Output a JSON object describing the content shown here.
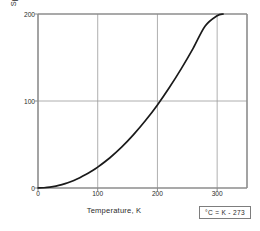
{
  "chart_data": {
    "type": "line",
    "title": "",
    "xlabel": "Temperature,  K",
    "ylabel": "Specific Enthalpy  Dh  in kJ.kg",
    "ylabel_exponent": "-1",
    "xlim": [
      0,
      350
    ],
    "ylim": [
      0,
      200
    ],
    "xticks": [
      0,
      100,
      200,
      300
    ],
    "xtick_labels": [
      "0",
      "100",
      "200",
      "300"
    ],
    "yticks": [
      0,
      100,
      200
    ],
    "ytick_labels": [
      "0",
      "100",
      "200"
    ],
    "grid": true,
    "legend": "none",
    "series": [
      {
        "name": "Specific enthalpy",
        "x": [
          0,
          10,
          20,
          30,
          40,
          50,
          60,
          70,
          80,
          90,
          100,
          120,
          140,
          160,
          180,
          200,
          220,
          240,
          260,
          280,
          300,
          310
        ],
        "y": [
          0,
          0.3,
          1.0,
          2.2,
          3.9,
          6.0,
          8.7,
          11.8,
          15.4,
          19.5,
          24.0,
          34.5,
          46.9,
          61.3,
          77.5,
          95.5,
          115.5,
          137.2,
          160.8,
          186.2,
          198.0,
          200.0
        ]
      }
    ],
    "annotations": [
      {
        "name": "unit-conversion",
        "text": "°C = K - 273"
      }
    ]
  },
  "axes": {
    "x_title": "Temperature,  K",
    "y_title_main": "Specific Enthalpy  Dh  in kJ.kg",
    "y_title_sup": "-1"
  },
  "note": {
    "text": "°C = K - 273"
  },
  "colors": {
    "curve": "#1a1a1a",
    "grid": "#9a9a9a",
    "axis": "#8c8c8c",
    "text": "#2b2b2b",
    "background": "#ffffff"
  }
}
